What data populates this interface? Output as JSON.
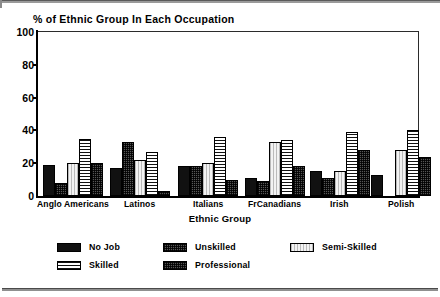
{
  "chart_data": {
    "type": "bar",
    "title": "% of Ethnic Group In Each Occupation",
    "xlabel": "Ethnic Group",
    "ylabel": "",
    "ylim": [
      0,
      100
    ],
    "yticks": [
      0,
      20,
      40,
      60,
      80,
      100
    ],
    "grid": false,
    "legend_position": "bottom",
    "categories": [
      "Anglo Americans",
      "Latinos",
      "Italians",
      "FrCanadians",
      "Irish",
      "Polish"
    ],
    "series": [
      {
        "name": "No Job",
        "swatch": "solid-black",
        "values": [
          19,
          17,
          18,
          11,
          15,
          13
        ]
      },
      {
        "name": "Unskilled",
        "swatch": "checker-dark",
        "values": [
          8,
          33,
          18,
          9,
          11,
          0
        ]
      },
      {
        "name": "Semi-Skilled",
        "swatch": "light-vertical",
        "values": [
          20,
          22,
          20,
          33,
          15,
          28
        ]
      },
      {
        "name": "Skilled",
        "swatch": "horizontal-lines",
        "values": [
          35,
          27,
          36,
          34,
          39,
          40
        ]
      },
      {
        "name": "Professional",
        "swatch": "checker-dark",
        "values": [
          20,
          3,
          10,
          18,
          28,
          24
        ]
      }
    ]
  },
  "legend": {
    "items": [
      {
        "label": "No Job",
        "swatch": "solid-black"
      },
      {
        "label": "Unskilled",
        "swatch": "checker-dark"
      },
      {
        "label": "Semi-Skilled",
        "swatch": "light-vertical"
      },
      {
        "label": "Skilled",
        "swatch": "horizontal-lines"
      },
      {
        "label": "Professional",
        "swatch": "checker-dark"
      }
    ]
  },
  "axis": {
    "y_tick_labels": [
      "100",
      "80",
      "60",
      "40",
      "20",
      "0"
    ],
    "x_title": "Ethnic Group"
  },
  "colors": {
    "ink": "#000000",
    "background": "#ffffff",
    "frame": "#2b2b2b",
    "rule": "#8f8f8f"
  }
}
